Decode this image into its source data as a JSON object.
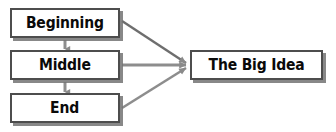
{
  "diagram": {
    "type": "flow-diagram",
    "nodes": [
      {
        "id": "beginning",
        "label": "Beginning"
      },
      {
        "id": "middle",
        "label": "Middle"
      },
      {
        "id": "end",
        "label": "End"
      },
      {
        "id": "bigidea",
        "label": "The Big Idea"
      }
    ],
    "edges": [
      {
        "from": "beginning",
        "to": "middle",
        "style": "vertical-arrow"
      },
      {
        "from": "middle",
        "to": "end",
        "style": "vertical-arrow"
      },
      {
        "from": "beginning",
        "to": "bigidea",
        "style": "diagonal-arrow"
      },
      {
        "from": "middle",
        "to": "bigidea",
        "style": "horizontal-arrow"
      },
      {
        "from": "end",
        "to": "bigidea",
        "style": "diagonal-arrow"
      }
    ]
  },
  "colors": {
    "box_fill": "#ffffff",
    "box_border": "#4d4d4d",
    "box_shadow": "#737373",
    "text": "#0a0a0a",
    "connector": "#808080",
    "background": "#ffffff"
  }
}
